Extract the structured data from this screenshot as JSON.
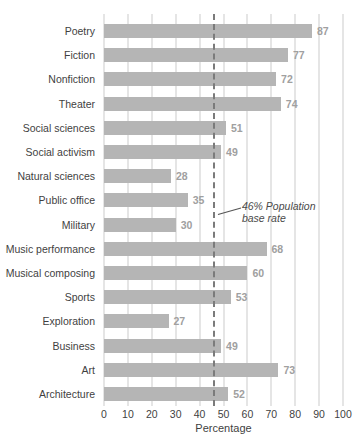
{
  "chart_data": {
    "type": "bar",
    "orientation": "horizontal",
    "title": "",
    "categories": [
      "Poetry",
      "Fiction",
      "Nonfiction",
      "Theater",
      "Social sciences",
      "Social activism",
      "Natural sciences",
      "Public office",
      "Military",
      "Music performance",
      "Musical composing",
      "Sports",
      "Exploration",
      "Business",
      "Art",
      "Architecture"
    ],
    "values": [
      87,
      77,
      72,
      74,
      51,
      49,
      28,
      35,
      30,
      68,
      60,
      53,
      27,
      49,
      73,
      52
    ],
    "xlabel": "Percentage",
    "xlim": [
      0,
      100
    ],
    "xticks": [
      0,
      10,
      20,
      30,
      40,
      50,
      60,
      70,
      80,
      90,
      100
    ],
    "grid": "vertical-only",
    "legend": "none",
    "reference_line": {
      "value": 46,
      "label": "46% Population base rate",
      "style": "dashed"
    },
    "colors": {
      "bar": "#b5b5b5",
      "gridline": "#cbcbcb",
      "value_label": "#a0a0a0",
      "category_label": "#3f3f3f",
      "reference_line": "#7b7b7b",
      "annotation": "#4a4a4a"
    }
  }
}
